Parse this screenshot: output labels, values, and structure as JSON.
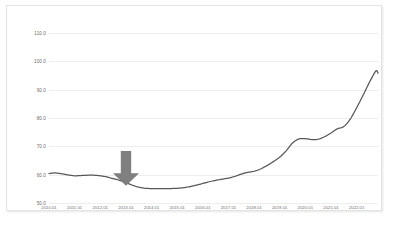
{
  "chart_data": {
    "type": "line",
    "title": "",
    "subtitle": "",
    "xlabel": "",
    "ylabel": "",
    "grid": true,
    "legend": "none",
    "ylim": [
      50.0,
      110.0
    ],
    "ytick_labels": [
      "110.0",
      "100.0",
      "90.0",
      "80.0",
      "70.0",
      "60.0",
      "50.0"
    ],
    "ytick_values": [
      110.0,
      100.0,
      90.0,
      80.0,
      70.0,
      60.0,
      50.0
    ],
    "xtick_labels": [
      "2010.01",
      "2011.01",
      "2012.01",
      "2013.01",
      "2014.01",
      "2015.01",
      "2016.01",
      "2017.01",
      "2018.01",
      "2019.01",
      "2020.01",
      "2021.01",
      "2022.01"
    ],
    "xlim": [
      "2010.01",
      "2022.11"
    ],
    "line_color": "#575757",
    "grid_color": "#ededed",
    "series": [
      {
        "name": "index",
        "x": [
          "2010.01",
          "2010.04",
          "2010.07",
          "2010.10",
          "2011.01",
          "2011.04",
          "2011.07",
          "2011.10",
          "2012.01",
          "2012.04",
          "2012.07",
          "2012.10",
          "2013.01",
          "2013.04",
          "2013.07",
          "2013.10",
          "2014.01",
          "2014.04",
          "2014.07",
          "2014.10",
          "2015.01",
          "2015.04",
          "2015.07",
          "2015.10",
          "2016.01",
          "2016.04",
          "2016.07",
          "2016.10",
          "2017.01",
          "2017.04",
          "2017.07",
          "2017.10",
          "2018.01",
          "2018.04",
          "2018.07",
          "2018.10",
          "2019.01",
          "2019.04",
          "2019.07",
          "2019.10",
          "2020.01",
          "2020.04",
          "2020.07",
          "2020.10",
          "2021.01",
          "2021.04",
          "2021.07",
          "2021.10",
          "2022.01",
          "2022.04",
          "2022.07",
          "2022.10",
          "2022.11"
        ],
        "values": [
          60.4,
          60.6,
          60.3,
          59.9,
          59.6,
          59.7,
          59.8,
          59.8,
          59.6,
          59.2,
          58.6,
          58.0,
          57.2,
          56.3,
          55.6,
          55.2,
          55.1,
          55.1,
          55.1,
          55.1,
          55.2,
          55.4,
          55.8,
          56.3,
          56.9,
          57.5,
          58.0,
          58.4,
          58.8,
          59.4,
          60.2,
          60.8,
          61.2,
          62.0,
          63.2,
          64.6,
          66.2,
          68.4,
          71.2,
          72.6,
          72.7,
          72.4,
          72.5,
          73.4,
          74.7,
          76.2,
          77.0,
          79.6,
          83.6,
          88.0,
          92.6,
          96.6,
          95.8
        ]
      }
    ],
    "annotations": [
      {
        "type": "arrow",
        "direction": "down",
        "color": "#7f7f7f",
        "x": "2013.01",
        "y_top": 68.5,
        "y_tip": 56.2,
        "label": ""
      }
    ]
  }
}
